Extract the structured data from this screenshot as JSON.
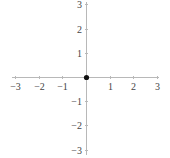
{
  "chart_data": {
    "type": "scatter",
    "title": "",
    "xlabel": "",
    "ylabel": "",
    "xlim": [
      -3,
      3
    ],
    "ylim": [
      -3,
      3
    ],
    "grid": false,
    "legend": null,
    "axes_style": "centered-cross",
    "x_ticks": [
      -3,
      -2,
      -1,
      1,
      2,
      3
    ],
    "x_tick_labels": [
      "−3",
      "−2",
      "−1",
      "1",
      "2",
      "3"
    ],
    "y_ticks": [
      -3,
      -2,
      -1,
      1,
      2,
      3
    ],
    "y_tick_labels": [
      "−3",
      "−2",
      "−1",
      "1",
      "2",
      "3"
    ],
    "series": [
      {
        "name": "point",
        "x": [
          0
        ],
        "y": [
          0
        ],
        "color": "#111111",
        "marker": "circle"
      }
    ]
  },
  "colors": {
    "axis": "#b8b8b8",
    "label": "#444444",
    "point": "#111111",
    "background": "#ffffff"
  },
  "layout": {
    "origin_px": [
      86,
      77
    ],
    "unit_px_x": 23.7,
    "unit_px_y": 24.2,
    "x_axis_extent_px": [
      12,
      159
    ],
    "y_axis_extent_px": [
      2,
      155
    ]
  }
}
